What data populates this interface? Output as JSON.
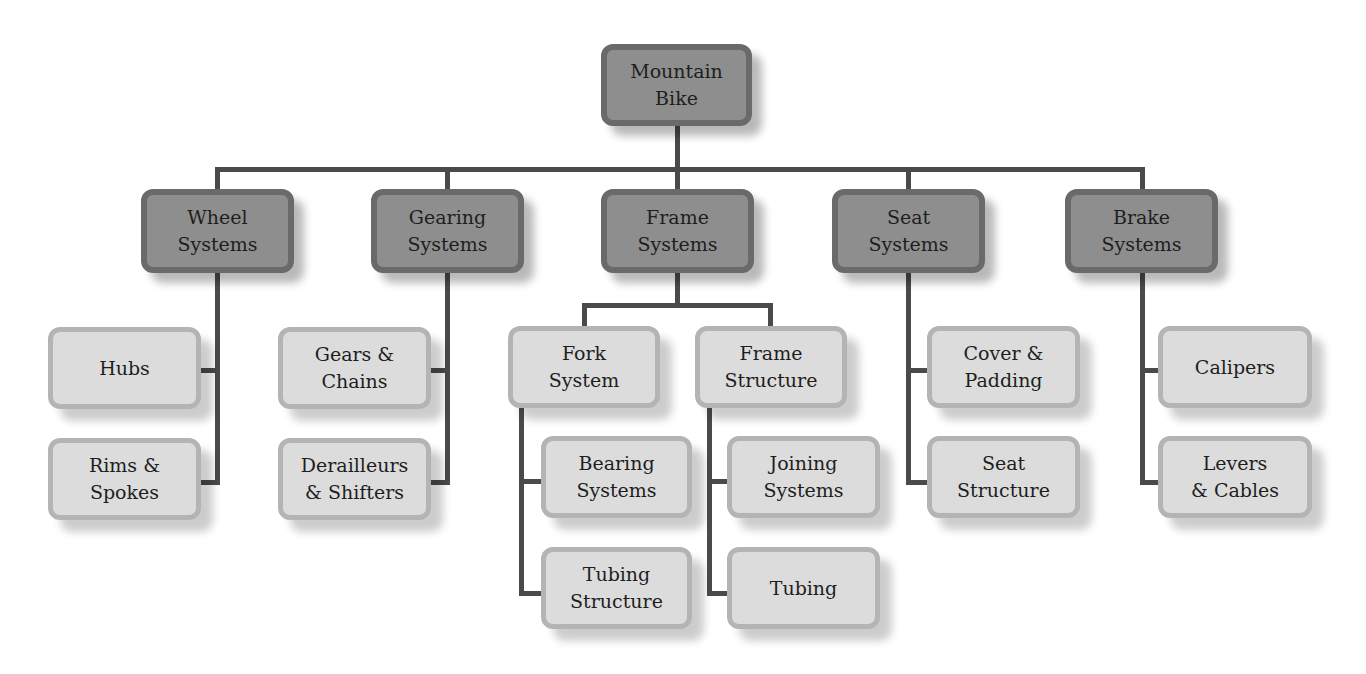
{
  "diagram": {
    "title": "Mountain Bike",
    "root": {
      "label": "Mountain\nBike"
    },
    "systems": [
      {
        "label": "Wheel\nSystems",
        "children": [
          {
            "label": "Hubs"
          },
          {
            "label": "Rims &\nSpokes"
          }
        ]
      },
      {
        "label": "Gearing\nSystems",
        "children": [
          {
            "label": "Gears &\nChains"
          },
          {
            "label": "Derailleurs\n& Shifters"
          }
        ]
      },
      {
        "label": "Frame\nSystems",
        "children": [
          {
            "label": "Fork\nSystem",
            "children": [
              {
                "label": "Bearing\nSystems"
              },
              {
                "label": "Tubing\nStructure"
              }
            ]
          },
          {
            "label": "Frame\nStructure",
            "children": [
              {
                "label": "Joining\nSystems"
              },
              {
                "label": "Tubing"
              }
            ]
          }
        ]
      },
      {
        "label": "Seat\nSystems",
        "children": [
          {
            "label": "Cover &\nPadding"
          },
          {
            "label": "Seat\nStructure"
          }
        ]
      },
      {
        "label": "Brake\nSystems",
        "children": [
          {
            "label": "Calipers"
          },
          {
            "label": "Levers\n& Cables"
          }
        ]
      }
    ]
  },
  "colors": {
    "dark_fill": "#8e8e8e",
    "dark_border": "#6a6a6a",
    "light_fill": "#dcdcdc",
    "light_border": "#b4b4b4",
    "connector": "#4a4a4a"
  }
}
